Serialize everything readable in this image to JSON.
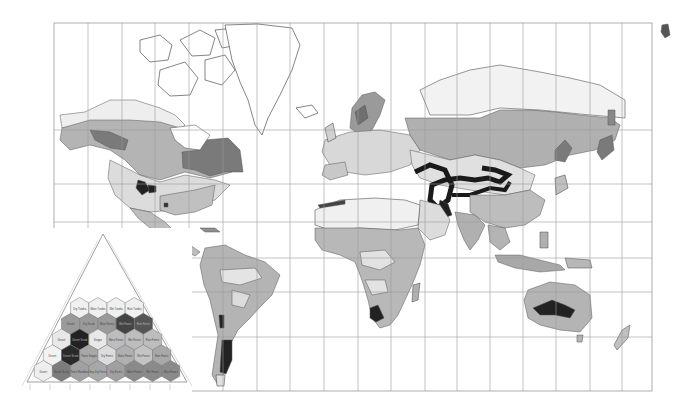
{
  "map": {
    "title": "World life zones (Holdridge classification) on Mercator projection",
    "frame": {
      "x": 54,
      "y": 23,
      "width": 598,
      "height": 368
    },
    "grid": {
      "vertical_x": [
        54,
        88,
        122,
        155,
        189,
        223,
        257,
        290,
        324,
        358,
        391,
        425,
        457,
        490,
        523,
        556,
        590,
        622,
        652
      ],
      "horizontal_y": [
        23,
        130,
        184,
        222,
        258,
        292,
        337,
        391
      ]
    },
    "colors": {
      "ocean": "#ffffff",
      "grid": "#9a9a9a",
      "coast": "#333333",
      "zone_lightest": "#e6e6e6",
      "zone_light": "#d2d2d2",
      "zone_mid": "#b8b8b8",
      "zone_midDark": "#9c9c9c",
      "zone_dark": "#7a7a7a",
      "zone_black": "#222222"
    }
  },
  "legend": {
    "type": "triangle",
    "apex": [
      103,
      234
    ],
    "base_left": [
      27,
      382
    ],
    "base_right": [
      187,
      382
    ],
    "hexagons": [
      {
        "row": 0,
        "shades": [
          "#f0f0f0",
          "#f0f0f0",
          "#f0f0f0",
          "#f0f0f0"
        ],
        "labels": [
          "Dry Tundra",
          "Moist Tundra",
          "Wet Tundra",
          "Rain Tundra"
        ]
      },
      {
        "row": 1,
        "shades": [
          "#9a9a9a",
          "#9a9a9a",
          "#9a9a9a",
          "#444444",
          "#555555"
        ],
        "labels": [
          "Desert",
          "Dry Scrub",
          "Moist Forest",
          "Wet Forest",
          "Rain Forest"
        ]
      },
      {
        "row": 2,
        "shades": [
          "#e8e8e8",
          "#222222",
          "#e8e8e8",
          "#bdbdbd",
          "#bdbdbd",
          "#bdbdbd"
        ],
        "labels": [
          "Desert",
          "Desert Scrub",
          "Steppe",
          "Moist Forest",
          "Wet Forest",
          "Rain Forest"
        ]
      },
      {
        "row": 3,
        "shades": [
          "#f2f2f2",
          "#2a2a2a",
          "#a8a8a8",
          "#dcdcdc",
          "#b0b0b0",
          "#c4c4c4",
          "#a8a8a8"
        ],
        "labels": [
          "Desert",
          "Desert Scrub",
          "Thorn Steppe",
          "Dry Forest",
          "Moist Forest",
          "Wet Forest",
          "Rain Forest"
        ]
      },
      {
        "row": 4,
        "shades": [
          "#eeeeee",
          "#7c7c7c",
          "#a0a0a0",
          "#a8a8a8",
          "#a0a0a0",
          "#8a8a8a",
          "#8a8a8a",
          "#8a8a8a"
        ],
        "labels": [
          "Desert",
          "Desert Scrub",
          "Thorn Woodland",
          "Very Dry Forest",
          "Dry Forest",
          "Moist Forest",
          "Wet Forest",
          "Rain Forest"
        ]
      }
    ]
  }
}
